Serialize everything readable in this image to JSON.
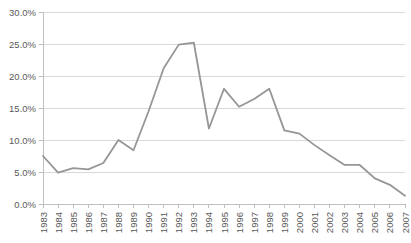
{
  "chart_data": {
    "type": "line",
    "title": "",
    "subtitle": "",
    "xlabel": "",
    "ylabel": "",
    "grid": "horizontal",
    "legend": "none",
    "ylim": [
      0,
      30
    ],
    "ytick_labels": [
      "0.0%",
      "5.0%",
      "10.0%",
      "15.0%",
      "20.0%",
      "25.0%",
      "30.0%"
    ],
    "ytick_values": [
      0,
      5,
      10,
      15,
      20,
      25,
      30
    ],
    "categories": [
      "1983",
      "1984",
      "1985",
      "1986",
      "1987",
      "1988",
      "1989",
      "1990",
      "1991",
      "1992",
      "1993",
      "1994",
      "1995",
      "1996",
      "1997",
      "1998",
      "1999",
      "2000",
      "2001",
      "2002",
      "2003",
      "2004",
      "2005",
      "2006",
      "2007"
    ],
    "series": [
      {
        "name": "",
        "color": "#969696",
        "values": [
          7.5,
          4.9,
          5.6,
          5.4,
          6.4,
          10.0,
          8.4,
          14.5,
          21.2,
          24.9,
          25.2,
          11.8,
          18.0,
          15.2,
          16.4,
          18.0,
          11.5,
          11.0,
          9.2,
          7.6,
          6.1,
          6.1,
          4.0,
          3.0,
          1.3
        ]
      }
    ]
  },
  "style": {
    "line_color": "#969696",
    "grid_color": "#d9d9d9",
    "axis_color": "#bfbfbf",
    "tick_color": "#bfbfbf",
    "label_color": "#595959",
    "background": "#ffffff"
  },
  "geometry": {
    "plot_left": 43,
    "plot_right": 405,
    "plot_top": 12,
    "plot_bottom": 204,
    "xlabel_rotation": -90
  }
}
